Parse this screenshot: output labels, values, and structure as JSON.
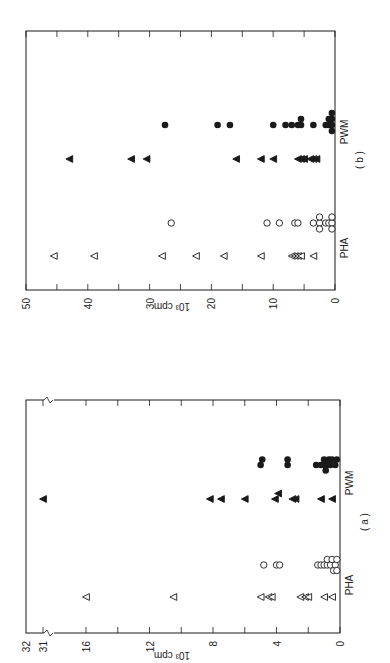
{
  "figure": {
    "orientation": "rotated 90 degrees counter-clockwise",
    "colors": {
      "ink": "#1a1a1a",
      "background": "#ffffff"
    }
  },
  "chart_data": [
    {
      "panel": "(b)",
      "type": "scatter",
      "title": "",
      "panel_label": "( b )",
      "ylabel": "10³ cpm",
      "yticks": [
        0,
        10,
        20,
        30,
        40,
        50
      ],
      "ylim": [
        0,
        50
      ],
      "minor_ticks_every": 5,
      "categories": [
        "PHA",
        "PWM"
      ],
      "grid": false,
      "series": [
        {
          "name": "PHA open triangle",
          "group": "PHA",
          "marker": "open-triangle",
          "values": [
            45.5,
            39,
            28,
            22.5,
            18,
            12,
            7,
            6.5,
            6,
            5.5,
            3.5
          ]
        },
        {
          "name": "PHA open circle",
          "group": "PHA",
          "marker": "open-circle",
          "values": [
            26.5,
            11,
            9,
            6.5,
            6,
            3.5,
            2.5,
            2.5,
            2.5,
            1.5,
            1,
            0.5,
            0.5,
            0.5
          ]
        },
        {
          "name": "PWM filled triangle",
          "group": "PWM",
          "marker": "filled-triangle",
          "values": [
            43,
            33,
            30.5,
            16,
            12,
            10,
            6,
            5.5,
            5,
            4,
            3.5,
            3
          ]
        },
        {
          "name": "PWM filled circle",
          "group": "PWM",
          "marker": "filled-circle",
          "values": [
            27.5,
            19,
            17,
            10,
            8,
            7,
            6,
            5.5,
            5.5,
            3.5,
            1.5,
            1,
            1,
            0.5,
            0.5,
            0.5,
            0.5
          ]
        }
      ]
    },
    {
      "panel": "(a)",
      "type": "scatter",
      "title": "",
      "panel_label": "( a )",
      "ylabel": "10³ cpm",
      "yticks": [
        0,
        4,
        8,
        12,
        16,
        31,
        32
      ],
      "ylim": [
        0,
        32
      ],
      "axis_break": "between 16 and 31",
      "minor_ticks_every": 2,
      "categories": [
        "PHA",
        "PWM"
      ],
      "grid": false,
      "series": [
        {
          "name": "PHA open triangle",
          "group": "PHA",
          "marker": "open-triangle",
          "values": [
            16,
            10.5,
            5,
            4.5,
            4.3,
            2.5,
            2.2,
            2.0,
            1.0,
            0.5
          ]
        },
        {
          "name": "PHA open circle",
          "group": "PHA",
          "marker": "open-circle",
          "values": [
            4.8,
            4.0,
            3.8,
            1.4,
            1.2,
            1.0,
            0.8,
            0.8,
            0.6,
            0.5,
            0.4,
            0.3,
            0.2,
            0.2
          ]
        },
        {
          "name": "PWM filled triangle",
          "group": "PWM",
          "marker": "filled-triangle",
          "values": [
            31,
            8.2,
            7.5,
            6,
            4.1,
            3.9,
            3,
            2.8,
            1.2,
            0.5
          ]
        },
        {
          "name": "PWM filled circle",
          "group": "PWM",
          "marker": "filled-circle",
          "values": [
            5,
            4.9,
            3.3,
            3.3,
            1.5,
            1.2,
            1.0,
            1.0,
            0.9,
            0.8,
            0.7,
            0.6,
            0.5,
            0.3,
            0.2
          ]
        }
      ]
    }
  ],
  "labels": {
    "b": {
      "panel": "( b )",
      "ylabel": "10³ cpm",
      "cat_pha": "PHA",
      "cat_pwm": "PWM",
      "ticks": [
        "0",
        "10",
        "20",
        "30",
        "40",
        "50"
      ]
    },
    "a": {
      "panel": "( a )",
      "ylabel": "10³ cpm",
      "cat_pha": "PHA",
      "cat_pwm": "PWM",
      "ticks": [
        "0",
        "4",
        "8",
        "12",
        "16",
        "31",
        "32"
      ]
    }
  }
}
